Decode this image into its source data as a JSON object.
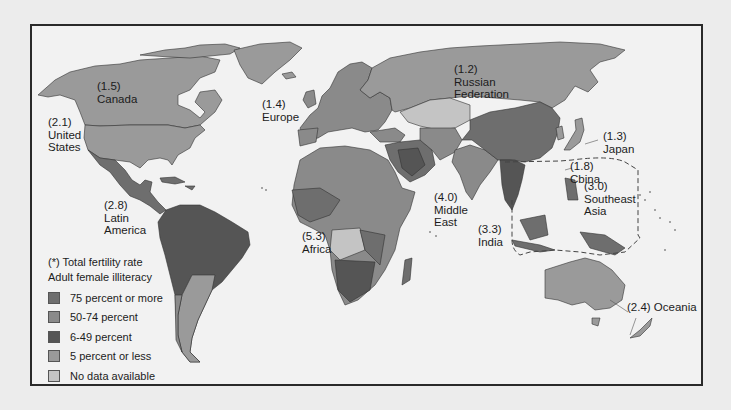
{
  "colors": {
    "page_bg": "#ececec",
    "ocean": "#f2f2f2",
    "pct75plus": "#6e6e6e",
    "pct50_74": "#8a8a8a",
    "pct6_49": "#555555",
    "pct5less": "#9a9a9a",
    "nodata": "#c4c4c4"
  },
  "regions": [
    {
      "rate": "(1.5)",
      "name": "Canada"
    },
    {
      "rate": "(2.1)",
      "name": "United\nStates"
    },
    {
      "rate": "(2.8)",
      "name": "Latin\nAmerica"
    },
    {
      "rate": "(1.4)",
      "name": "Europe"
    },
    {
      "rate": "(1.2)",
      "name": "Russian\nFederation"
    },
    {
      "rate": "(5.3)",
      "name": "Africa"
    },
    {
      "rate": "(4.0)",
      "name": "Middle\nEast"
    },
    {
      "rate": "(3.3)",
      "name": "India"
    },
    {
      "rate": "(1.3)",
      "name": "Japan"
    },
    {
      "rate": "(1.8)",
      "name": "Cbina"
    },
    {
      "rate": "(3.0)",
      "name": "Southeast\nAsia"
    },
    {
      "rate": "(2.4)",
      "name": "Oceania"
    }
  ],
  "legend": {
    "note": "(*) Total fertility rate",
    "title": "Adult female illiteracy",
    "items": [
      {
        "label": "75 percent or more",
        "color": "#6e6e6e"
      },
      {
        "label": "50-74 percent",
        "color": "#8a8a8a"
      },
      {
        "label": "6-49 percent",
        "color": "#555555"
      },
      {
        "label": "5 percent or less",
        "color": "#9a9a9a"
      },
      {
        "label": "No data available",
        "color": "#c4c4c4"
      }
    ]
  }
}
